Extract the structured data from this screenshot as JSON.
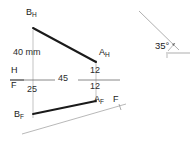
{
  "drawing": {
    "type": "orthographic-projection",
    "description": "Engineering descriptive-geometry problem: horizontal (top) and frontal (front) views of line AB with reference line H/F, plus a separate inclined line at 35 degrees",
    "colors": {
      "object_line": "#1a1a1a",
      "thin_line": "#8a8a8a",
      "reference_line": "#555555",
      "text": "#1a1a1a",
      "background": "#ffffff"
    },
    "labels": {
      "b_top": "B",
      "b_top_sub": "H",
      "a_top": "A",
      "a_top_sub": "H",
      "b_front": "B",
      "b_front_sub": "F",
      "a_front": "A",
      "a_front_sub": "F",
      "fold_h": "H",
      "fold_f": "F",
      "aux_f": "F"
    },
    "dimensions": {
      "height_40": "40 mm",
      "dist_45": "45",
      "a_above": "12",
      "a_below": "12",
      "b_below": "25"
    },
    "angle": {
      "value": "35",
      "unit": "°",
      "text": "35°"
    },
    "points": {
      "B_H": {
        "x": 33,
        "y": 25
      },
      "A_H": {
        "x": 96,
        "y": 63
      },
      "B_F": {
        "x": 33,
        "y": 113
      },
      "A_F": {
        "x": 96,
        "y": 100
      },
      "hf_line_left": {
        "x": 10,
        "y": 80
      },
      "hf_line_right": {
        "x": 120,
        "y": 80
      }
    },
    "aux_line": {
      "start": {
        "x": 140,
        "y": 12
      },
      "end": {
        "x": 178,
        "y": 50
      },
      "base_start": {
        "x": 165,
        "y": 53
      },
      "base_end": {
        "x": 190,
        "y": 53
      }
    },
    "ground_line": {
      "start": {
        "x": 22,
        "y": 133
      },
      "end": {
        "x": 125,
        "y": 104
      }
    }
  }
}
